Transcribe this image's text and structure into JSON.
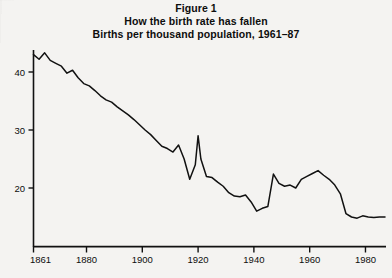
{
  "figure": {
    "title_lines": [
      "Figure 1",
      "How the birth rate has fallen",
      "Births per thousand population, 1961–87"
    ]
  },
  "chart_data": {
    "type": "line",
    "title": "How the birth rate has fallen",
    "subtitle": "Births per thousand population, 1961–87",
    "figure_label": "Figure 1",
    "xlabel": "",
    "ylabel": "",
    "xlim": [
      1861,
      1987
    ],
    "ylim": [
      13,
      45
    ],
    "grid": false,
    "legend": "none",
    "line_color": "#111111",
    "background_color": "#f4f3f1",
    "xticks": [
      1861,
      1880,
      1900,
      1920,
      1940,
      1960,
      1980
    ],
    "xtick_labels": [
      "1861",
      "1880",
      "1900",
      "1920",
      "1940",
      "1960",
      "1980"
    ],
    "yticks": [
      20,
      30,
      40
    ],
    "ytick_labels": [
      "20",
      "30",
      "40"
    ],
    "series": [
      {
        "name": "Births per thousand population",
        "x": [
          1861,
          1863,
          1865,
          1867,
          1869,
          1871,
          1873,
          1875,
          1877,
          1879,
          1881,
          1883,
          1885,
          1887,
          1889,
          1891,
          1893,
          1895,
          1897,
          1899,
          1901,
          1903,
          1905,
          1907,
          1909,
          1911,
          1913,
          1915,
          1917,
          1919,
          1920,
          1921,
          1923,
          1925,
          1927,
          1929,
          1931,
          1933,
          1935,
          1937,
          1939,
          1941,
          1943,
          1945,
          1947,
          1949,
          1951,
          1953,
          1955,
          1957,
          1959,
          1961,
          1963,
          1965,
          1967,
          1969,
          1971,
          1973,
          1975,
          1977,
          1979,
          1981,
          1983,
          1985,
          1987
        ],
        "y": [
          43.0,
          42.2,
          43.3,
          42.0,
          41.5,
          41.0,
          39.8,
          40.3,
          39.0,
          38.0,
          37.6,
          36.8,
          35.9,
          35.2,
          34.8,
          34.0,
          33.3,
          32.6,
          31.8,
          30.9,
          30.0,
          29.2,
          28.2,
          27.2,
          26.8,
          26.2,
          27.4,
          25.0,
          21.5,
          24.0,
          29.0,
          25.0,
          22.0,
          21.8,
          21.0,
          20.3,
          19.2,
          18.6,
          18.5,
          18.8,
          17.6,
          16.0,
          16.5,
          16.8,
          22.4,
          20.8,
          20.3,
          20.5,
          20.0,
          21.5,
          22.0,
          22.5,
          23.0,
          22.2,
          21.5,
          20.5,
          19.0,
          15.6,
          15.0,
          14.8,
          15.2,
          15.0,
          14.9,
          15.0,
          15.0
        ]
      }
    ]
  }
}
